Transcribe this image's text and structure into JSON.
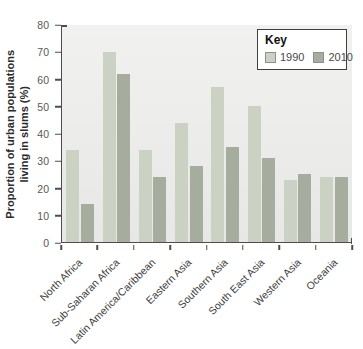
{
  "chart_data": {
    "type": "bar",
    "title": "",
    "ylabel": "Proportion of urban populations living in slums (%)",
    "ylabel_lines": [
      "Proportion of urban populations",
      "living in slums (%)"
    ],
    "xlabel": "",
    "ylim": [
      0,
      80
    ],
    "yticks": [
      0,
      10,
      20,
      30,
      40,
      50,
      60,
      70,
      80
    ],
    "grid": false,
    "categories": [
      "North Africa",
      "Sub-Saharan Africa",
      "Latin America/Caribbean",
      "Eastern Asia",
      "Southern Asia",
      "South East Asia",
      "Western Asia",
      "Oceania"
    ],
    "series": [
      {
        "name": "1990",
        "color": "#cbd2c3",
        "values": [
          34,
          70,
          34,
          44,
          57,
          50,
          23,
          24
        ]
      },
      {
        "name": "2010",
        "color": "#a6ad9f",
        "values": [
          14,
          62,
          24,
          28,
          35,
          31,
          25,
          24
        ]
      }
    ],
    "legend": {
      "title": "Key",
      "position": "top-right"
    }
  },
  "colors": {
    "axis": "#4d4d4d",
    "plot_background_top": "#f1f2f0",
    "plot_background_bottom": "#e7e8e5",
    "tick_label": "#595959",
    "category_label": "#3e3e3e",
    "legend_border": "#3f3f3f"
  }
}
